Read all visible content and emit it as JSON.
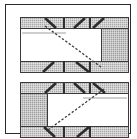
{
  "figure": {
    "title": "Two-panel truss cross-section diagram",
    "panel_count": 2,
    "frame_border_color": "#2b2b2b",
    "background_color": "#ffffff"
  },
  "colors": {
    "hatch_fill": "#a9a9a9",
    "endblock_fill": "#9e9e9e",
    "outline": "#3a3a3a",
    "strut": "#2b2b2b",
    "web_rule": "#cfcfcf",
    "white": "#ffffff"
  },
  "panels": [
    {
      "id": "panel-top",
      "label": "Top panel",
      "endblock_side": "right",
      "diagonal_direction": "descending-left-to-right",
      "band_top_label": "top chord band",
      "band_bottom_label": "bottom chord band",
      "web_rule_side": "left",
      "stub_positions_top": [
        42,
        68
      ],
      "stub_positions_bottom": [
        42,
        68
      ]
    },
    {
      "id": "panel-bottom",
      "label": "Bottom panel",
      "endblock_side": "left",
      "diagonal_direction": "ascending-left-to-right",
      "band_top_label": "top chord band",
      "band_bottom_label": "bottom chord band",
      "web_rule_side": "right",
      "stub_positions_top": [
        42,
        68
      ],
      "stub_positions_bottom": [
        42,
        68
      ]
    }
  ]
}
